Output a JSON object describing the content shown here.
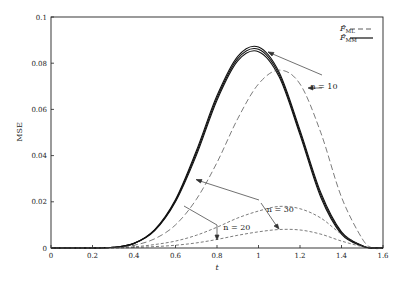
{
  "chart_data": {
    "type": "line",
    "title": "",
    "xlabel": "t",
    "ylabel": "MSE",
    "xlim": [
      0,
      1.6
    ],
    "ylim": [
      0,
      0.1
    ],
    "grid": false,
    "legend_position": "top-right",
    "x_ticks": [
      0,
      0.2,
      0.4,
      0.6,
      0.8,
      1,
      1.2,
      1.4,
      1.6
    ],
    "x_tick_labels": [
      "0",
      "0.2",
      "0.4",
      "0.6",
      "0.8",
      "1",
      "1.2",
      "1.4",
      "1.6"
    ],
    "y_ticks": [
      0,
      0.02,
      0.04,
      0.06,
      0.08,
      0.1
    ],
    "y_tick_labels": [
      "0",
      "0.02",
      "0.04",
      "0.06",
      "0.08",
      "0.1"
    ],
    "legend": [
      {
        "label": "F̂",
        "subscript": "ML",
        "style": "dashed"
      },
      {
        "label": "F̂",
        "subscript": "MM",
        "style": "solid"
      }
    ],
    "x": [
      0.2,
      0.3,
      0.4,
      0.5,
      0.6,
      0.7,
      0.8,
      0.9,
      1.0,
      1.1,
      1.2,
      1.3,
      1.4,
      1.5,
      1.55
    ],
    "series": [
      {
        "name": "MM n=10",
        "style": "solid",
        "values": [
          0.0,
          0.0003,
          0.002,
          0.008,
          0.021,
          0.042,
          0.066,
          0.083,
          0.087,
          0.076,
          0.051,
          0.024,
          0.007,
          0.001,
          0.0
        ]
      },
      {
        "name": "MM n=20",
        "style": "solid",
        "values": [
          0.0,
          0.0003,
          0.002,
          0.0078,
          0.0205,
          0.041,
          0.065,
          0.082,
          0.086,
          0.075,
          0.05,
          0.023,
          0.0065,
          0.001,
          0.0
        ]
      },
      {
        "name": "MM n=30",
        "style": "solid",
        "values": [
          0.0,
          0.0003,
          0.0019,
          0.0075,
          0.02,
          0.04,
          0.064,
          0.081,
          0.085,
          0.074,
          0.049,
          0.022,
          0.006,
          0.0008,
          0.0
        ]
      },
      {
        "name": "ML n=10",
        "style": "dashed",
        "values": [
          0.0,
          0.0002,
          0.0012,
          0.004,
          0.01,
          0.021,
          0.037,
          0.056,
          0.071,
          0.077,
          0.071,
          0.05,
          0.022,
          0.004,
          0.0
        ]
      },
      {
        "name": "ML n=20",
        "style": "dashed",
        "values": [
          0.0,
          0.0001,
          0.0005,
          0.0015,
          0.003,
          0.0055,
          0.009,
          0.013,
          0.016,
          0.018,
          0.017,
          0.013,
          0.006,
          0.001,
          0.0
        ]
      },
      {
        "name": "ML n=30",
        "style": "dashed",
        "values": [
          0.0,
          0.0,
          0.0002,
          0.0006,
          0.0012,
          0.0022,
          0.0037,
          0.0055,
          0.007,
          0.008,
          0.0078,
          0.006,
          0.003,
          0.0006,
          0.0
        ]
      }
    ],
    "annotations": [
      {
        "text": "n = 10",
        "x": 1.25,
        "y": 0.07
      },
      {
        "text": "n = 20",
        "x": 0.83,
        "y": 0.009
      },
      {
        "text": "n = 30",
        "x": 1.04,
        "y": 0.017
      }
    ]
  }
}
